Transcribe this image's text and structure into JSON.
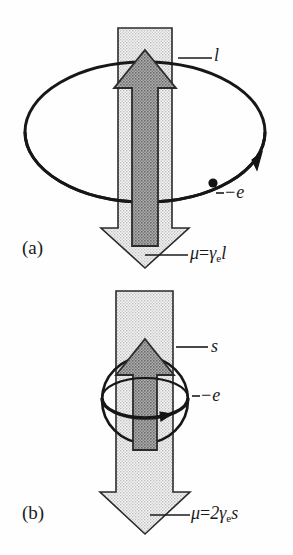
{
  "figure": {
    "caption_panels": [
      {
        "tag": "(a)",
        "angular_momentum_symbol": "l",
        "charge_label": "−e",
        "moment_formula_mu": "μ",
        "moment_formula_eq": "=",
        "moment_formula_coeff": "",
        "moment_formula_gamma": "γ",
        "moment_formula_gamma_sub": "e",
        "moment_formula_rhs": "l"
      },
      {
        "tag": "(b)",
        "angular_momentum_symbol": "s",
        "charge_label": "−e",
        "moment_formula_mu": "μ",
        "moment_formula_eq": "=",
        "moment_formula_coeff": "2",
        "moment_formula_gamma": "γ",
        "moment_formula_gamma_sub": "e",
        "moment_formula_rhs": "s"
      }
    ],
    "colors": {
      "outline": "#1b1b1b",
      "stipple_light": "#dcdcdc",
      "stipple_dark": "#8f8f8f",
      "background": "#fefefe",
      "ink": "#1a1a1a"
    },
    "icon_names": [
      "down-arrow-magnetic-moment",
      "up-arrow-angular-momentum",
      "orbit-ellipse",
      "electron-dot",
      "orbit-direction-arrowhead",
      "spin-sphere-circle",
      "spin-equator-ellipse",
      "leader-line"
    ]
  }
}
